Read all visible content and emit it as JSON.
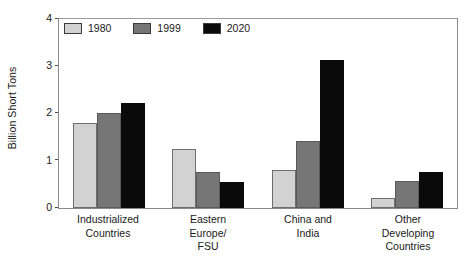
{
  "chart_data": {
    "type": "bar",
    "title": "",
    "xlabel": "",
    "ylabel": "Billion Short Tons",
    "ylim": [
      0,
      4
    ],
    "yticks": [
      0,
      1,
      2,
      3,
      4
    ],
    "ytick_labels": [
      "0",
      "1",
      "2",
      "3",
      "4"
    ],
    "grid": false,
    "legend_position": "top-left inside plot area",
    "categories": [
      "Industrialized Countries",
      "Eastern Europe/ FSU",
      "China and India",
      "Other Developing Countries"
    ],
    "category_lines": [
      [
        "Industrialized",
        "Countries"
      ],
      [
        "Eastern",
        "Europe/",
        "FSU"
      ],
      [
        "China and",
        "India"
      ],
      [
        "Other",
        "Developing",
        "Countries"
      ]
    ],
    "series": [
      {
        "name": "1980",
        "color": "#d2d2d2",
        "values": [
          1.8,
          1.25,
          0.8,
          0.22
        ]
      },
      {
        "name": "1999",
        "color": "#767676",
        "values": [
          2.0,
          0.75,
          1.42,
          0.57
        ]
      },
      {
        "name": "2020",
        "color": "#0a0a0a",
        "values": [
          2.22,
          0.55,
          3.12,
          0.75
        ]
      }
    ]
  }
}
